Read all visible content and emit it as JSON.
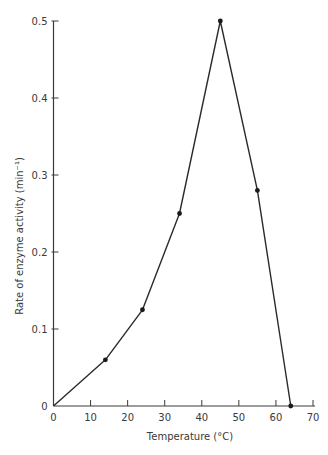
{
  "chart_data": {
    "type": "line",
    "title": "",
    "xlabel": "Temperature (°C)",
    "ylabel": "Rate of enzyme activity (min⁻¹)",
    "xlim": [
      0,
      70
    ],
    "ylim": [
      0,
      0.5
    ],
    "xticks": [
      0,
      10,
      20,
      30,
      40,
      50,
      60,
      70
    ],
    "yticks": [
      0,
      0.1,
      0.2,
      0.3,
      0.4,
      0.5
    ],
    "xtick_labels": [
      "0",
      "10",
      "20",
      "30",
      "40",
      "50",
      "60",
      "70"
    ],
    "ytick_labels": [
      "0",
      "0.1",
      "0.2",
      "0.3",
      "0.4",
      "0.5"
    ],
    "grid": false,
    "legend": null,
    "series": [
      {
        "name": "Enzyme activity",
        "x": [
          0,
          14,
          24,
          34,
          45,
          55,
          64
        ],
        "y": [
          0,
          0.06,
          0.125,
          0.25,
          0.5,
          0.28,
          0
        ]
      }
    ]
  },
  "colors": {
    "line": "#2a2a2a",
    "axis": "#3a3a3a",
    "marker": "#1a1a1a"
  }
}
